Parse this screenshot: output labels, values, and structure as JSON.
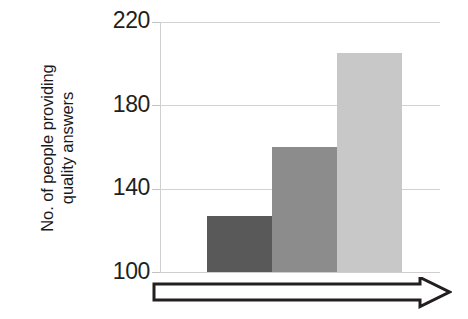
{
  "chart_data": {
    "type": "bar",
    "title": "",
    "subtitle": "",
    "xlabel": "",
    "ylabel": "No. of people providing quality answers",
    "ylabel_lines": [
      "No. of people providing",
      "quality answers"
    ],
    "categories": [
      "1",
      "2",
      "3"
    ],
    "values": [
      127,
      160,
      205
    ],
    "series": [
      {
        "name": "No. of people providing quality answers",
        "values": [
          127,
          160,
          205
        ]
      }
    ],
    "ylim": [
      100,
      220
    ],
    "yticks": [
      100,
      140,
      180,
      220
    ],
    "ytick_labels": [
      "100",
      "140",
      "180",
      "220"
    ],
    "xticks": [],
    "xtick_labels": [],
    "grid": true,
    "grid_axis": "y",
    "legend": false,
    "legend_position": "none",
    "bar_colors": [
      "#595959",
      "#8c8c8c",
      "#c8c8c8"
    ],
    "annotations": [
      {
        "type": "arrow",
        "name": "increasing-trend-arrow",
        "direction": "right",
        "style": "hollow-block",
        "label": ""
      }
    ]
  },
  "axis": {
    "tick_0": "100",
    "tick_1": "140",
    "tick_2": "180",
    "tick_3": "220"
  },
  "colors": {
    "bar_dark": "#595959",
    "bar_medium": "#8c8c8c",
    "bar_light": "#c8c8c8",
    "gridline": "#d2d2d2",
    "text": "#231f20",
    "arrow_outline": "#231f20",
    "arrow_fill": "#ffffff",
    "background": "#ffffff"
  }
}
